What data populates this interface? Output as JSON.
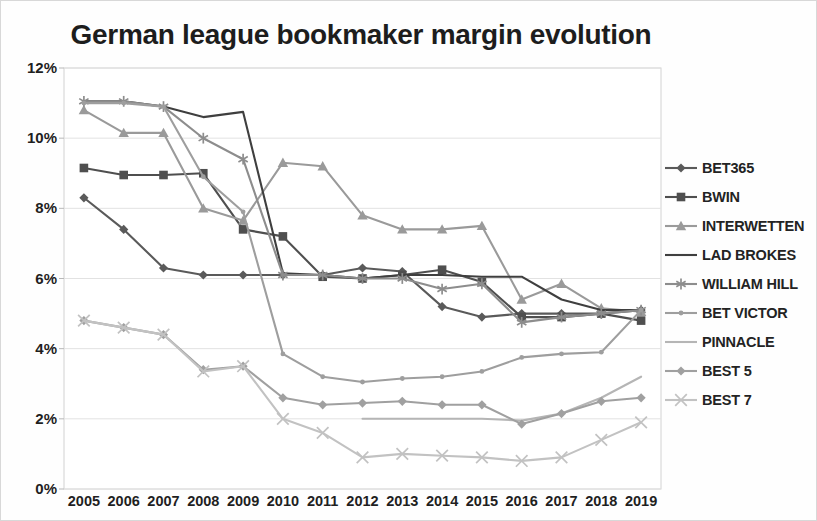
{
  "chart_title": "German league bookmaker margin evolution",
  "axis": {
    "y_ticks": [
      "0%",
      "2%",
      "4%",
      "6%",
      "8%",
      "10%",
      "12%"
    ],
    "x_ticks": [
      "2005",
      "2006",
      "2007",
      "2008",
      "2009",
      "2010",
      "2011",
      "2012",
      "2013",
      "2014",
      "2015",
      "2016",
      "2017",
      "2018",
      "2019"
    ],
    "y_label": "",
    "x_label": ""
  },
  "legend": {
    "position": "right",
    "items": [
      {
        "label": "BET365",
        "color": "#5a5a5a",
        "marker": "diamond"
      },
      {
        "label": "BWIN",
        "color": "#4f4f4f",
        "marker": "square"
      },
      {
        "label": "INTERWETTEN",
        "color": "#9a9a9a",
        "marker": "triangle"
      },
      {
        "label": "LAD BROKES",
        "color": "#3f3f3f",
        "marker": "none"
      },
      {
        "label": "WILLIAM HILL",
        "color": "#8d8d8d",
        "marker": "asterisk"
      },
      {
        "label": "BET VICTOR",
        "color": "#9e9e9e",
        "marker": "dot"
      },
      {
        "label": "PINNACLE",
        "color": "#b5b5b5",
        "marker": "none"
      },
      {
        "label": "BEST 5",
        "color": "#a0a0a0",
        "marker": "diamond"
      },
      {
        "label": "BEST 7",
        "color": "#c2c2c2",
        "marker": "x"
      }
    ]
  },
  "chart_data": {
    "type": "line",
    "title": "German league bookmaker margin evolution",
    "xlabel": "",
    "ylabel": "",
    "ylim": [
      0,
      12
    ],
    "yunit": "%",
    "grid": true,
    "legend_position": "right",
    "categories": [
      "2005",
      "2006",
      "2007",
      "2008",
      "2009",
      "2010",
      "2011",
      "2012",
      "2013",
      "2014",
      "2015",
      "2016",
      "2017",
      "2018",
      "2019"
    ],
    "series": [
      {
        "name": "BET365",
        "color": "#5a5a5a",
        "marker": "diamond",
        "values": [
          8.3,
          7.4,
          6.3,
          6.1,
          6.1,
          6.1,
          6.1,
          6.3,
          6.2,
          5.2,
          4.9,
          5.0,
          5.0,
          5.0,
          5.1
        ]
      },
      {
        "name": "BWIN",
        "color": "#4f4f4f",
        "marker": "square",
        "values": [
          9.15,
          8.95,
          8.95,
          9.0,
          7.4,
          7.2,
          6.05,
          6.0,
          6.1,
          6.25,
          5.9,
          4.9,
          4.9,
          5.0,
          4.8
        ]
      },
      {
        "name": "INTERWETTEN",
        "color": "#9a9a9a",
        "marker": "triangle",
        "values": [
          10.8,
          10.15,
          10.15,
          8.0,
          7.65,
          9.3,
          9.2,
          7.8,
          7.4,
          7.4,
          7.5,
          5.4,
          5.85,
          5.15,
          5.05
        ]
      },
      {
        "name": "LAD BROKES",
        "color": "#3f3f3f",
        "marker": "none",
        "values": [
          11.05,
          11.05,
          10.9,
          10.6,
          10.75,
          6.15,
          6.1,
          6.0,
          6.1,
          6.1,
          6.05,
          6.05,
          5.4,
          5.1,
          5.1
        ]
      },
      {
        "name": "WILLIAM HILL",
        "color": "#8d8d8d",
        "marker": "asterisk",
        "values": [
          11.05,
          11.05,
          10.9,
          10.0,
          9.4,
          6.1,
          6.1,
          6.0,
          6.0,
          5.7,
          5.85,
          4.75,
          4.9,
          5.0,
          5.1
        ]
      },
      {
        "name": "BET VICTOR",
        "color": "#9e9e9e",
        "marker": "dot",
        "values": [
          11.0,
          11.0,
          10.9,
          8.9,
          7.9,
          3.85,
          3.2,
          3.05,
          3.15,
          3.2,
          3.35,
          3.75,
          3.85,
          3.9,
          5.1
        ]
      },
      {
        "name": "PINNACLE",
        "color": "#b5b5b5",
        "marker": "none",
        "values": [
          null,
          null,
          null,
          null,
          null,
          null,
          null,
          2.0,
          2.0,
          2.0,
          2.0,
          1.95,
          2.15,
          2.6,
          3.2
        ]
      },
      {
        "name": "BEST 5",
        "color": "#a0a0a0",
        "marker": "diamond",
        "values": [
          4.8,
          4.6,
          4.4,
          3.4,
          3.5,
          2.6,
          2.4,
          2.45,
          2.5,
          2.4,
          2.4,
          1.85,
          2.15,
          2.5,
          2.6
        ]
      },
      {
        "name": "BEST 7",
        "color": "#c2c2c2",
        "marker": "x",
        "values": [
          4.8,
          4.6,
          4.4,
          3.35,
          3.5,
          2.0,
          1.6,
          0.9,
          1.0,
          0.95,
          0.9,
          0.8,
          0.9,
          1.4,
          1.9
        ]
      }
    ]
  }
}
